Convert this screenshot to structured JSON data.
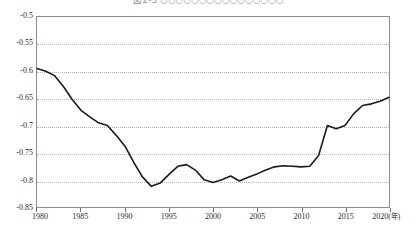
{
  "title": "図2-3 ○○○○○○○○○○○○○○○○",
  "axis": {
    "x_unit": "(年)",
    "x_ticks": [
      "1980",
      "1985",
      "1990",
      "1995",
      "2000",
      "2005",
      "2010",
      "2015",
      "2020"
    ],
    "y_ticks": [
      "-0.5",
      "-0.55",
      "-0.6",
      "-0.65",
      "-0.7",
      "-0.75",
      "-0.8",
      "-0.85"
    ]
  },
  "style": {
    "line_color": "#1a1a1a",
    "grid_color": "#b6b6b6",
    "frame_color": "#8d8d8d",
    "background": "#ffffff"
  },
  "chart_data": {
    "type": "line",
    "title": "図2-3 ○○○○○○○○○○○○○○○○",
    "xlabel": "(年)",
    "ylabel": "",
    "xlim": [
      1980,
      2020
    ],
    "ylim": [
      -0.85,
      -0.5
    ],
    "grid": true,
    "legend": "none",
    "x_tick_values": [
      1980,
      1985,
      1990,
      1995,
      2000,
      2005,
      2010,
      2015,
      2020
    ],
    "y_tick_values": [
      -0.5,
      -0.55,
      -0.6,
      -0.65,
      -0.7,
      -0.75,
      -0.8,
      -0.85
    ],
    "series": [
      {
        "name": "series-1",
        "x": [
          1980,
          1981,
          1982,
          1983,
          1984,
          1985,
          1986,
          1987,
          1988,
          1989,
          1990,
          1991,
          1992,
          1993,
          1994,
          1995,
          1996,
          1997,
          1998,
          1999,
          2000,
          2001,
          2002,
          2003,
          2004,
          2005,
          2006,
          2007,
          2008,
          2009,
          2010,
          2011,
          2012,
          2013,
          2014,
          2015,
          2016,
          2017,
          2018,
          2019,
          2020
        ],
        "values": [
          -0.595,
          -0.6,
          -0.608,
          -0.628,
          -0.652,
          -0.672,
          -0.684,
          -0.695,
          -0.7,
          -0.718,
          -0.738,
          -0.768,
          -0.795,
          -0.812,
          -0.806,
          -0.79,
          -0.775,
          -0.772,
          -0.782,
          -0.8,
          -0.805,
          -0.8,
          -0.793,
          -0.802,
          -0.795,
          -0.789,
          -0.782,
          -0.776,
          -0.774,
          -0.775,
          -0.776,
          -0.775,
          -0.755,
          -0.7,
          -0.706,
          -0.7,
          -0.678,
          -0.663,
          -0.66,
          -0.655,
          -0.648
        ]
      }
    ]
  }
}
